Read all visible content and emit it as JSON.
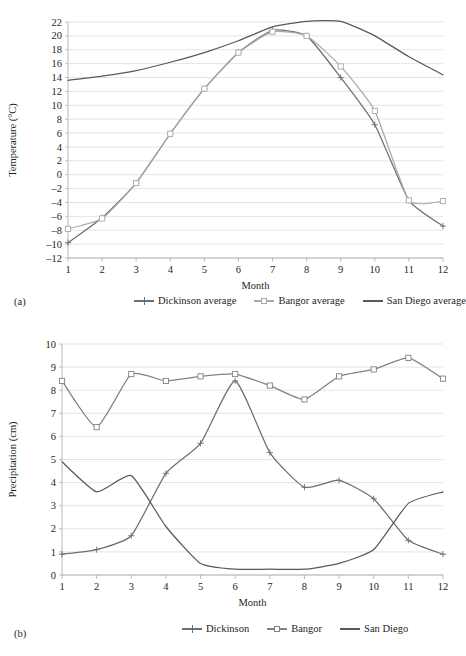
{
  "figures": [
    {
      "panel_label": "(a)",
      "chart_data": {
        "type": "line",
        "title": "",
        "xlabel": "Month",
        "ylabel": "Temperature (°C)",
        "x": [
          1,
          2,
          3,
          4,
          5,
          6,
          7,
          8,
          9,
          10,
          11,
          12
        ],
        "xlim": [
          1,
          12
        ],
        "ylim": [
          -12,
          22
        ],
        "ytick_step": 2,
        "yticks": [
          "22",
          "20",
          "18",
          "16",
          "14",
          "12",
          "10",
          "8",
          "6",
          "4",
          "2",
          "0",
          "–2",
          "–4",
          "–6",
          "–8",
          "–10",
          "–12"
        ],
        "xticks": [
          "1",
          "2",
          "3",
          "4",
          "5",
          "6",
          "7",
          "8",
          "9",
          "10",
          "11",
          "12"
        ],
        "grid": "horizontal",
        "legend_position": "below",
        "series": [
          {
            "name": "Dickinson average",
            "color": "#6d6e71",
            "marker": "plus",
            "values": [
              -9.8,
              -6.2,
              -1.2,
              5.9,
              12.4,
              17.6,
              20.8,
              20.0,
              14.0,
              7.2,
              -3.7,
              -7.4
            ]
          },
          {
            "name": "Bangor average",
            "color": "#a7a9ac",
            "marker": "square",
            "values": [
              -7.8,
              -6.3,
              -1.2,
              5.9,
              12.4,
              17.6,
              20.6,
              20.0,
              15.6,
              9.2,
              -3.7,
              -3.8
            ]
          },
          {
            "name": "San Diego average",
            "color": "#58595b",
            "marker": "none",
            "values": [
              13.6,
              14.2,
              15.0,
              16.2,
              17.6,
              19.3,
              21.3,
              22.1,
              22.1,
              20.0,
              17.0,
              14.4
            ]
          }
        ]
      }
    },
    {
      "panel_label": "(b)",
      "chart_data": {
        "type": "line",
        "title": "",
        "xlabel": "Month",
        "ylabel": "Precipitation (cm)",
        "x": [
          1,
          2,
          3,
          4,
          5,
          6,
          7,
          8,
          9,
          10,
          11,
          12
        ],
        "xlim": [
          1,
          12
        ],
        "ylim": [
          0,
          10
        ],
        "ytick_step": 1,
        "yticks": [
          "10",
          "9",
          "8",
          "7",
          "6",
          "5",
          "4",
          "3",
          "2",
          "1",
          "0"
        ],
        "xticks": [
          "1",
          "2",
          "3",
          "4",
          "5",
          "6",
          "7",
          "8",
          "9",
          "10",
          "11",
          "12"
        ],
        "grid": "horizontal",
        "legend_position": "below",
        "series": [
          {
            "name": "Dickinson",
            "color": "#6d6e71",
            "marker": "plus",
            "values": [
              0.9,
              1.1,
              1.7,
              4.4,
              5.7,
              8.4,
              5.3,
              3.8,
              4.1,
              3.3,
              1.5,
              0.9
            ]
          },
          {
            "name": "Bangor",
            "color": "#808285",
            "marker": "square",
            "values": [
              8.4,
              6.4,
              8.7,
              8.4,
              8.6,
              8.7,
              8.2,
              7.6,
              8.6,
              8.9,
              9.4,
              8.5
            ]
          },
          {
            "name": "San Diego",
            "color": "#58595b",
            "marker": "none",
            "values": [
              4.9,
              3.6,
              4.3,
              2.1,
              0.5,
              0.25,
              0.25,
              0.25,
              0.5,
              1.1,
              3.1,
              3.6
            ]
          }
        ]
      }
    }
  ]
}
